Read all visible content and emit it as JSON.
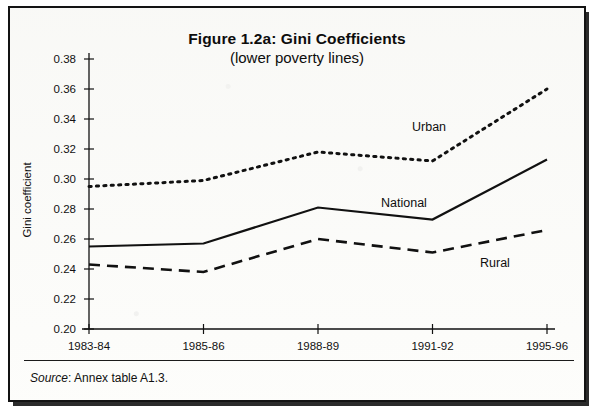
{
  "figure": {
    "title": "Figure 1.2a: Gini Coefficients",
    "subtitle": "(lower poverty lines)",
    "source_label": "Source",
    "source_separator": ":",
    "source_text": "Annex table A1.3."
  },
  "chart_data": {
    "type": "line",
    "title": "Figure 1.2a: Gini Coefficients",
    "subtitle": "(lower poverty lines)",
    "xlabel": "",
    "ylabel": "Gini coefficient",
    "categories": [
      "1983-84",
      "1985-86",
      "1988-89",
      "1991-92",
      "1995-96"
    ],
    "ylim": [
      0.2,
      0.38
    ],
    "ytick_step": 0.02,
    "yticks": [
      "0.38",
      "0.36",
      "0.34",
      "0.32",
      "0.30",
      "0.28",
      "0.26",
      "0.24",
      "0.22",
      "0.20"
    ],
    "grid": false,
    "legend_position": "inline-annotations",
    "series": [
      {
        "name": "Urban",
        "style": "dotted",
        "color": "#111111",
        "values": [
          0.295,
          0.299,
          0.318,
          0.312,
          0.36
        ],
        "annotation": "Urban"
      },
      {
        "name": "National",
        "style": "solid",
        "color": "#111111",
        "values": [
          0.255,
          0.257,
          0.281,
          0.273,
          0.313
        ],
        "annotation": "National"
      },
      {
        "name": "Rural",
        "style": "dashed",
        "color": "#111111",
        "values": [
          0.243,
          0.238,
          0.26,
          0.251,
          0.266
        ],
        "annotation": "Rural"
      }
    ]
  },
  "colors": {
    "ink": "#111111",
    "paper": "#fdfdfb",
    "frame": "#131313"
  }
}
